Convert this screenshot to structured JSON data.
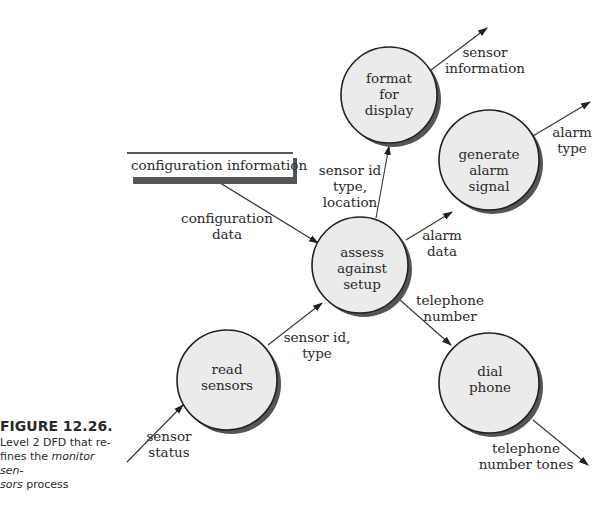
{
  "caption": {
    "title": "FIGURE 12.26.",
    "line1": "Level 2 DFD that re-",
    "line2_pre": "fines the ",
    "line2_em": "monitor sen-",
    "line3_em": "sors",
    "line3_post": " process"
  },
  "data_store": {
    "label": "configuration information"
  },
  "processes": {
    "format": [
      "format",
      "for",
      "display"
    ],
    "generate": [
      "generate",
      "alarm",
      "signal"
    ],
    "assess": [
      "assess",
      "against",
      "setup"
    ],
    "read": [
      "read",
      "sensors"
    ],
    "dial": [
      "dial",
      "phone"
    ]
  },
  "flows": {
    "sensor_information": [
      "sensor",
      "information"
    ],
    "alarm_type": [
      "alarm",
      "type"
    ],
    "configuration_data": [
      "configuration",
      "data"
    ],
    "sensor_id_type_location": [
      "sensor id",
      "type,",
      "location"
    ],
    "alarm_data": [
      "alarm",
      "data"
    ],
    "telephone_number": [
      "telephone",
      "number"
    ],
    "sensor_id_type": [
      "sensor id,",
      "type"
    ],
    "sensor_status": [
      "sensor",
      "status"
    ],
    "telephone_number_tones": [
      "telephone",
      "number tones"
    ]
  },
  "colors": {
    "bubble_fill": "#ebebeb",
    "shadow": "#555555",
    "stroke": "#222222"
  }
}
